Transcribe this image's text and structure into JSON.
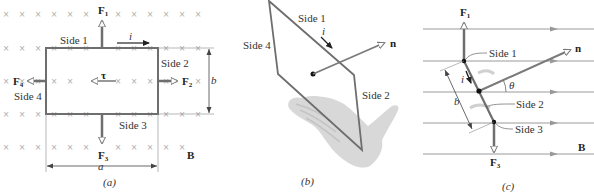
{
  "figure": {
    "panels": [
      {
        "id": "a",
        "caption": "(a)",
        "labels": {
          "side1": "Side 1",
          "side2": "Side 2",
          "side3": "Side 3",
          "side4": "Side 4",
          "current": "i",
          "torque": "τ",
          "dim_a": "a",
          "dim_b": "b",
          "field": "B"
        },
        "forces": [
          {
            "name": "F",
            "sub": "1",
            "direction": "up"
          },
          {
            "name": "F",
            "sub": "2",
            "direction": "right"
          },
          {
            "name": "F",
            "sub": "3",
            "direction": "down"
          },
          {
            "name": "F",
            "sub": "4",
            "direction": "left"
          }
        ],
        "field_symbol": "×"
      },
      {
        "id": "b",
        "caption": "(b)",
        "labels": {
          "side1": "Side 1",
          "side2": "Side 2",
          "side4": "Side 4",
          "current": "i",
          "normal": "n"
        }
      },
      {
        "id": "c",
        "caption": "(c)",
        "labels": {
          "side1": "Side 1",
          "side2": "Side 2",
          "side3": "Side 3",
          "current": "i",
          "dim_b": "b",
          "angle": "θ",
          "normal": "n",
          "field": "B"
        },
        "forces": [
          {
            "name": "F",
            "sub": "1",
            "direction": "up"
          },
          {
            "name": "F",
            "sub": "3",
            "direction": "down"
          }
        ]
      }
    ],
    "colors": {
      "line": "#7a7a7a",
      "dark": "#222222",
      "cross": "#b0b0b0",
      "hand": "#d6d6d6",
      "field_line": "#9a9a9a"
    }
  }
}
